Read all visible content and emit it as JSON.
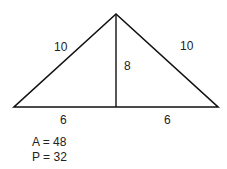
{
  "diagram": {
    "shape": "isosceles triangle with altitude",
    "labels": {
      "left_side": "10",
      "right_side": "10",
      "height": "8",
      "left_base": "6",
      "right_base": "6"
    },
    "results": {
      "area": "A = 48",
      "perimeter": "P = 32"
    },
    "colors": {
      "stroke": "#111111",
      "text": "#222222"
    }
  }
}
